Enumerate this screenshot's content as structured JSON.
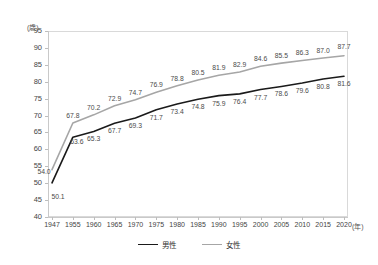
{
  "chart_data": {
    "type": "line",
    "title": "",
    "xlabel": "年",
    "ylabel": "歳",
    "x_unit_label": "(年)",
    "y_unit_label": "(歳)",
    "categories": [
      "1947",
      "1955",
      "1960",
      "1965",
      "1970",
      "1975",
      "1980",
      "1985",
      "1990",
      "1995",
      "2000",
      "2005",
      "2010",
      "2015",
      "2020"
    ],
    "ylim": [
      40,
      95
    ],
    "ytick_step": 5,
    "yticks": [
      "95",
      "90",
      "85",
      "80",
      "75",
      "70",
      "65",
      "60",
      "55",
      "50",
      "45",
      "40"
    ],
    "grid": false,
    "legend_position": "bottom-center",
    "series": [
      {
        "name": "男性",
        "color": "#1a1a1a",
        "values": [
          50.1,
          63.6,
          65.3,
          67.7,
          69.3,
          71.7,
          73.4,
          74.8,
          75.9,
          76.4,
          77.7,
          78.6,
          79.6,
          80.8,
          81.6
        ],
        "labels": [
          "50.1",
          "63.6",
          "65.3",
          "67.7",
          "69.3",
          "71.7",
          "73.4",
          "74.8",
          "75.9",
          "76.4",
          "77.7",
          "78.6",
          "79.6",
          "80.8",
          "81.6"
        ]
      },
      {
        "name": "女性",
        "color": "#a6a6a6",
        "values": [
          54.0,
          67.8,
          70.2,
          72.9,
          74.7,
          76.9,
          78.8,
          80.5,
          81.9,
          82.9,
          84.6,
          85.5,
          86.3,
          87.0,
          87.7
        ],
        "labels": [
          "54.0",
          "67.8",
          "70.2",
          "72.9",
          "74.7",
          "76.9",
          "78.8",
          "80.5",
          "81.9",
          "82.9",
          "84.6",
          "85.5",
          "86.3",
          "87.0",
          "87.7"
        ]
      }
    ],
    "legend": [
      {
        "label": "男性",
        "color": "#1a1a1a"
      },
      {
        "label": "女性",
        "color": "#a6a6a6"
      }
    ]
  }
}
